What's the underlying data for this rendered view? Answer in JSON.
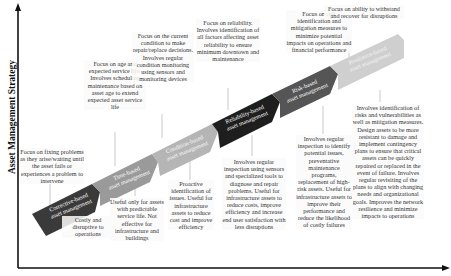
{
  "diagram": {
    "y_axis_label": "Asset Management Strategy",
    "colors": {
      "corrective": "#3a3a3a",
      "time": "#9a9a9a",
      "condition": "#b5b5b5",
      "reliability": "#1e1e1e",
      "risk": "#555555",
      "resilience": "#cfcfcf",
      "connector": "#bbbbbb",
      "axis": "#111111"
    },
    "stages": [
      {
        "label_line1": "Corrective-based",
        "label_line2": "asset management",
        "above": "Focus on fixing problems as they arise/waiting until the asset fails or experiences a problem to intervene",
        "below": "Costly and disruptive to operations"
      },
      {
        "label_line1": "Time-based",
        "label_line2": "asset management",
        "above": "Focus on age and expected service life. Involves scheduling maintenance based on asset age to extend expected asset service life",
        "below": "Useful only for assets with predictable service life. Not effective for infrastructure and buildings"
      },
      {
        "label_line1": "Condition-based",
        "label_line2": "asset management",
        "above": "Focus on the current condition to make repair/replace decisions. Involves regular condition monitoring using sensors and monitoring devices",
        "below": "Proactive identification of issues. Useful for infrastructure assets to reduce cost and improve efficiency"
      },
      {
        "label_line1": "Reliability-based",
        "label_line2": "asset management",
        "above": "Focus on reliability. Involves identification of all factors affecting asset reliability to ensure minimum downtown and maintenance",
        "below": "Involves regular inspection using sensors and specialized tools to diagnose and repair problems. Useful for infrastructure assets to reduce costs, improve efficiency and increase end user satisfaction with less disruptions"
      },
      {
        "label_line1": "Risk-based",
        "label_line2": "asset management",
        "above": "Focus on risk identification and mitigation measures to minimize potential impacts on operations and financial performance",
        "below": "Involves regular inspection to identify potential issues, preventative maintenance programs, replacement of high-risk assets. Useful for infrastructure assets to improve their performance and reduce the likelihood of costly failures"
      },
      {
        "label_line1": "Resilience-based",
        "label_line2": "asset management",
        "above": "Focus on ability to withstand and recover for disruptions",
        "below": "Involves identification of risks and vulnerabilities as well as mitigation measures. Design assets to be more resistant to damage and implement contingency plans to ensure that critical assets can be quickly repaired or replaced in the event of failure. Involves regular revisiting of the plans to align with changing needs and organizational goals. Improves the network resilience and minimize impacts to operations"
      }
    ]
  }
}
